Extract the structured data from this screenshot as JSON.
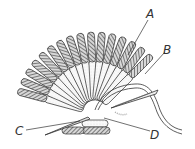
{
  "figure": {
    "labels": [
      {
        "id": "A",
        "text": "A"
      },
      {
        "id": "B",
        "text": "B"
      },
      {
        "id": "C",
        "text": "C"
      },
      {
        "id": "D",
        "text": "D"
      }
    ]
  },
  "colors": {
    "ink": "#333333",
    "hatch": "#555555",
    "background": "#ffffff"
  }
}
